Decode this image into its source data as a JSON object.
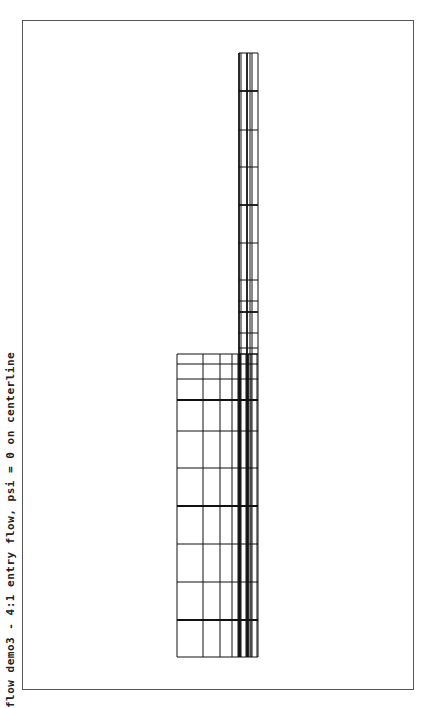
{
  "title": "flow demo3 - 4:1 entry flow, psi = 0 on centerline",
  "colors": {
    "line": "#111111",
    "frame": "#555555",
    "background": "#ffffff"
  },
  "mesh": {
    "narrow_channel": {
      "x_lines": [
        239,
        241,
        247,
        250,
        252,
        258
      ],
      "bold_x": [
        239,
        247
      ],
      "y_top": 53,
      "y_bottom": 657,
      "y_lines": [
        53,
        91,
        130,
        167,
        205,
        243,
        280,
        301,
        312,
        333,
        348,
        354
      ],
      "bold_y": [
        91,
        205,
        312
      ]
    },
    "wide_channel": {
      "x_lines": [
        177,
        203,
        220,
        232,
        238,
        240,
        246,
        248,
        251,
        257
      ],
      "bold_x": [
        240,
        248
      ],
      "x_left": 177,
      "x_right": 258,
      "y_lines": [
        354,
        364,
        379,
        400,
        431,
        468,
        506,
        544,
        582,
        620,
        657
      ],
      "bold_y": [
        400,
        506,
        620
      ]
    }
  }
}
